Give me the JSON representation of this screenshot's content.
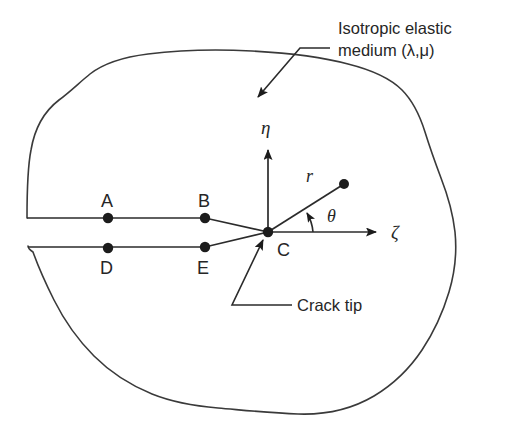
{
  "figure": {
    "background_color": "#ffffff",
    "line_color": "#3a3a3a",
    "text_color": "#262626"
  },
  "annotations": {
    "medium_line1": "Isotropic elastic",
    "medium_line2": "medium (λ,μ)",
    "crack_tip": "Crack tip"
  },
  "axes": {
    "vertical_label": "η",
    "horizontal_label": "ζ"
  },
  "polar": {
    "radius_label": "r",
    "angle_label": "θ"
  },
  "nodes": [
    {
      "id": "A",
      "label": "A",
      "x": 108,
      "y": 218,
      "label_x": 103,
      "label_y": 207,
      "face": "upper"
    },
    {
      "id": "B",
      "label": "B",
      "x": 205,
      "y": 218,
      "label_x": 200,
      "label_y": 207,
      "face": "upper"
    },
    {
      "id": "C",
      "label": "C",
      "x": 268,
      "y": 232,
      "label_x": 276,
      "label_y": 254,
      "face": "tip"
    },
    {
      "id": "D",
      "label": "D",
      "x": 205,
      "y": 247,
      "label_x": 199,
      "label_y": 272,
      "face": "lower"
    },
    {
      "id": "E",
      "label": "E",
      "x": 108,
      "y": 248,
      "label_x": 102,
      "label_y": 272,
      "face": "lower"
    }
  ],
  "field_point": {
    "x": 344,
    "y": 184
  }
}
